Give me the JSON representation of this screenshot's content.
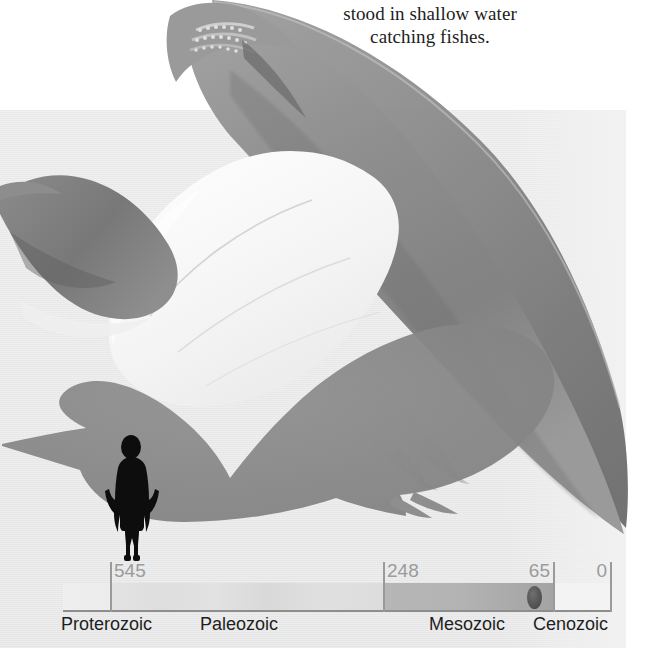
{
  "caption": {
    "line1": "stood in shallow water",
    "line2": "catching fishes."
  },
  "illustration": {
    "subject": "pterosaur-quetzalcoatlus",
    "scale_silhouette": "pterosaur-and-human-scale-comparison",
    "background_color": "#e7e7e7",
    "wing_color": "#8e8e8e",
    "body_color": "#f4f4f4",
    "silhouette_color": "#8a8a8a",
    "human_color": "#111111"
  },
  "timeline": {
    "name": "geologic-time-scale",
    "ticks": [
      {
        "label": "545",
        "mya": 545
      },
      {
        "label": "248",
        "mya": 248
      },
      {
        "label": "65",
        "mya": 65
      },
      {
        "label": "0",
        "mya": 0
      }
    ],
    "eras": [
      {
        "label": "Proterozoic",
        "color": "#efefef"
      },
      {
        "label": "Paleozoic",
        "color": "#e0e0e0"
      },
      {
        "label": "Mesozoic",
        "color": "#b0b0b0"
      },
      {
        "label": "Cenozoic",
        "color": "#f3f3f3"
      }
    ],
    "marker": {
      "name": "era-position-marker",
      "era": "Mesozoic",
      "mya": 70,
      "color": "#5a5a5a"
    },
    "rule_color": "#8e8e8e",
    "number_color": "#9b9b9b",
    "label_color": "#1e1e1e"
  }
}
